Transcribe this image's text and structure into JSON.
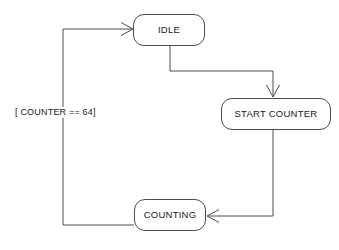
{
  "diagram": {
    "type": "state-machine",
    "background_color": "#ffffff",
    "stroke_color": "#4d4d4d",
    "text_color": "#1a1a1a",
    "states": [
      {
        "id": "idle",
        "label": "IDLE",
        "x": 133,
        "y": 14,
        "width": 72,
        "height": 32
      },
      {
        "id": "start_counter",
        "label": "START COUNTER",
        "x": 221,
        "y": 98,
        "width": 110,
        "height": 32
      },
      {
        "id": "counting",
        "label": "COUNTING",
        "x": 134,
        "y": 199,
        "width": 72,
        "height": 32
      }
    ],
    "transitions": [
      {
        "id": "idle-to-start-counter",
        "from": "idle",
        "to": "start_counter",
        "label": "",
        "arrow_direction": "down"
      },
      {
        "id": "start-counter-to-counting",
        "from": "start_counter",
        "to": "counting",
        "label": "",
        "arrow_direction": "left"
      },
      {
        "id": "counting-to-idle",
        "from": "counting",
        "to": "idle",
        "label": "[ COUNTER == 64]",
        "arrow_direction": "right"
      }
    ]
  }
}
